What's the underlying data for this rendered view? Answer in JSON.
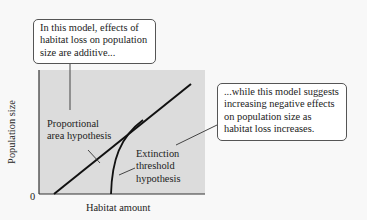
{
  "diagram": {
    "title": "",
    "axes": {
      "x_label": "Habitat amount",
      "y_label": "Population size",
      "origin_label": "0"
    },
    "curves": [
      {
        "name": "Proportional area hypothesis",
        "shape": "straight line",
        "label_lines": [
          "Proportional",
          "area hypothesis"
        ]
      },
      {
        "name": "Extinction threshold hypothesis",
        "shape": "curve rising steeply from threshold, merging with straight line",
        "label_lines": [
          "Extinction",
          "threshold",
          "hypothesis"
        ]
      }
    ],
    "callouts": [
      {
        "target": "proportional-area-curve",
        "lines": [
          "In this model, effects of",
          "habitat loss on population",
          "size are additive..."
        ]
      },
      {
        "target": "extinction-threshold-curve",
        "lines": [
          "...while this model suggests",
          "increasing negative effects",
          "on population size  as",
          "habitat loss increases."
        ]
      }
    ],
    "colors": {
      "plot_background": "#dcdcdc",
      "page_background": "#f8f8f8",
      "line": "#111111",
      "callout_border": "#555555"
    }
  }
}
